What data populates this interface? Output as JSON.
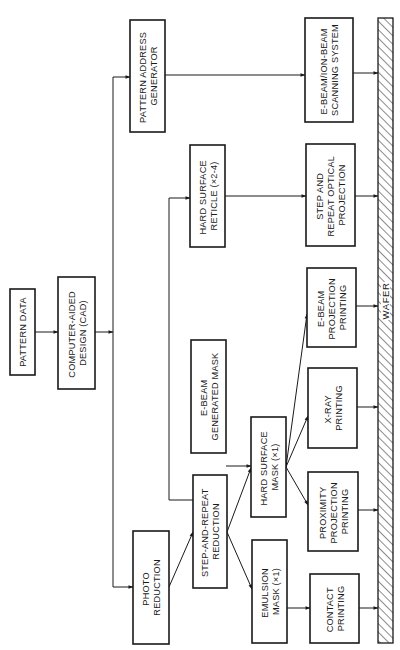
{
  "page_number": "",
  "boxes": {
    "pattern_data": {
      "lines": [
        "PATTERN DATA"
      ]
    },
    "cad": {
      "lines": [
        "COMPUTER-AIDED",
        "DESIGN (CAD)"
      ]
    },
    "pattern_address_generator": {
      "lines": [
        "PATTERN ADDRESS",
        "GENERATOR"
      ]
    },
    "photo_reduction": {
      "lines": [
        "PHOTO",
        "REDUCTION"
      ]
    },
    "hard_surface_reticle": {
      "lines": [
        "HARD SURFACE",
        "RETICLE (×2-4)"
      ]
    },
    "ebeam_generated_mask": {
      "lines": [
        "E-BEAM",
        "GENERATED MASK"
      ]
    },
    "step_and_repeat_reduction": {
      "lines": [
        "STEP-AND-REPEAT",
        "REDUCTION"
      ]
    },
    "hard_surface_mask": {
      "lines": [
        "HARD SURFACE",
        "MASK (×1)"
      ]
    },
    "emulsion_mask": {
      "lines": [
        "EMULSION",
        "MASK (×1)"
      ]
    },
    "ebeam_ionbeam_scanning": {
      "lines": [
        "E-BEAM/ION-BEAM",
        "SCANNING SYSTEM"
      ]
    },
    "step_repeat_optical": {
      "lines": [
        "STEP AND",
        "REPEAT OPTICAL",
        "PROJECTION"
      ]
    },
    "ebeam_projection_printing": {
      "lines": [
        "E-BEAM",
        "PROJECTION",
        "PRINTING"
      ]
    },
    "xray_printing": {
      "lines": [
        "X-RAY",
        "PRINTING"
      ]
    },
    "proximity_projection_printing": {
      "lines": [
        "PROXIMITY",
        "PROJECTION",
        "PRINTING"
      ]
    },
    "contact_printing": {
      "lines": [
        "CONTACT",
        "PRINTING"
      ]
    }
  },
  "wafer": {
    "label": "WAFER"
  },
  "colors": {
    "ink": "#1a1a1a",
    "paper": "#ffffff"
  }
}
